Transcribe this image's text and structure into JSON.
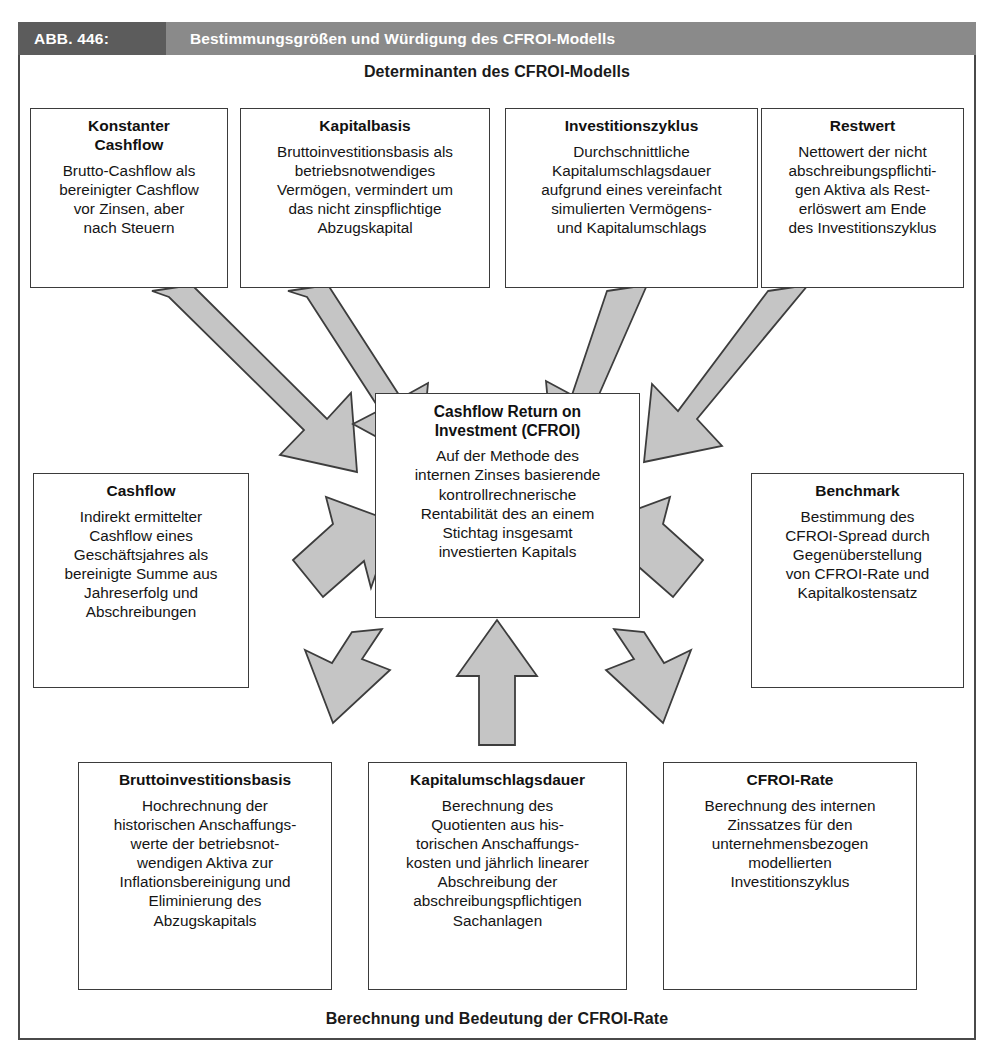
{
  "caption": {
    "number": "ABB. 446:",
    "title": "Bestimmungsgrößen und Würdigung des CFROI-Modells"
  },
  "headings": {
    "top": "Determinanten des CFROI-Modells",
    "bottom": "Berechnung und Bedeutung der CFROI-Rate"
  },
  "center_node": {
    "title": "Cashflow Return on\nInvestment (CFROI)",
    "body": "Auf der Methode des\ninternen Zinses basierende\nkontrollrechnerische\nRentabilität des an einem\nStichtag insgesamt\ninvestierten Kapitals"
  },
  "top_row": [
    {
      "title": "Konstanter\nCashflow",
      "body": "Brutto-Cashflow als\nbereinigter Cashflow\nvor Zinsen, aber\nnach Steuern"
    },
    {
      "title": "Kapitalbasis",
      "body": "Bruttoinvestitionsbasis als\nbetriebsnotwendiges\nVermögen, vermindert um\ndas nicht zinspflichtige\nAbzugskapital"
    },
    {
      "title": "Investitionszyklus",
      "body": "Durchschnittliche\nKapitalumschlagsdauer\naufgrund eines vereinfacht\nsimulierten Vermögens-\nund Kapitalumschlags"
    },
    {
      "title": "Restwert",
      "body": "Nettowert der nicht\nabschreibungspflichti-\ngen Aktiva als Rest-\nerlöswert am Ende\ndes Investitionszyklus"
    }
  ],
  "middle_row": [
    {
      "title": "Cashflow",
      "body": "Indirekt ermittelter\nCashflow eines\nGeschäftsjahres als\nbereinigte Summe aus\nJahreserfolg und\nAbschreibungen"
    },
    {
      "title": "Benchmark",
      "body": "Bestimmung des\nCFROI-Spread durch\nGegenüberstellung\nvon CFROI-Rate und\nKapitalkostensatz"
    }
  ],
  "bottom_row": [
    {
      "title": "Bruttoinvestitionsbasis",
      "body": "Hochrechnung der\nhistorischen Anschaffungs-\nwerte der betriebsnot-\nwendigen Aktiva zur\nInflationsbereinigung und\nEliminierung des\nAbzugskapitals"
    },
    {
      "title": "Kapitalumschlagsdauer",
      "body": "Berechnung des\nQuotienten aus his-\ntorischen Anschaffungs-\nkosten und jährlich linearer\nAbschreibung der\nabschreibungspflichtigen\nSachanlagen"
    },
    {
      "title": "CFROI-Rate",
      "body": "Berechnung des internen\nZinssatzes für den\nunternehmensbezogen\nmodellierten\nInvestitionszyklus"
    }
  ],
  "colors": {
    "caption_number_bg": "#5c5c5c",
    "caption_title_bg": "#8a8a8a",
    "caption_text": "#ffffff",
    "box_border": "#3b3b3b",
    "frame_border": "#4a4a4a",
    "arrow_fill": "#c5c5c5",
    "arrow_stroke": "#3d3d3d",
    "text": "#151515"
  }
}
